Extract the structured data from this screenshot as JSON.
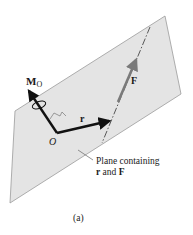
{
  "figure": {
    "caption": "(a)",
    "labels": {
      "moment": "M",
      "moment_sub": "O",
      "origin": "O",
      "position_vector": "r",
      "force": "F",
      "plane_line1": "Plane containing",
      "plane_line2_r": "r",
      "plane_line2_and": " and ",
      "plane_line2_F": "F"
    },
    "colors": {
      "plane_fill": "#e4e4e4",
      "plane_edge": "#9a9a9a",
      "vector": "#111111",
      "force_vector": "#7a7a7a"
    }
  }
}
